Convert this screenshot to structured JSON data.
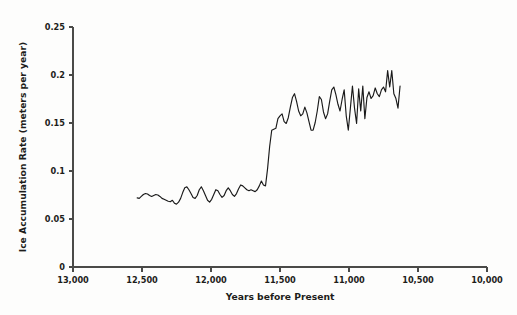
{
  "chart_data": {
    "type": "line",
    "title": "",
    "xlabel": "Years before Present",
    "ylabel": "Ice Accumulation Rate (meters per year)",
    "xlim": [
      13000,
      10000
    ],
    "ylim": [
      0,
      0.25
    ],
    "x_ticks": [
      13000,
      12500,
      12000,
      11500,
      11000,
      10500,
      10000
    ],
    "x_tick_labels": [
      "13,000",
      "12,500",
      "12,000",
      "11,500",
      "11,000",
      "10,500",
      "10,000"
    ],
    "y_ticks": [
      0,
      0.05,
      0.1,
      0.15,
      0.2,
      0.25
    ],
    "y_tick_labels": [
      "0",
      "0.05",
      "0.1",
      "0.15",
      "0.2",
      "0.25"
    ],
    "x_axis_inverted": true,
    "grid": false,
    "legend": null,
    "legend_position": "none",
    "series": [
      {
        "name": "Ice accumulation rate",
        "color": "#1a1a1a",
        "x": [
          12535,
          12520,
          12505,
          12490,
          12475,
          12460,
          12445,
          12430,
          12415,
          12400,
          12385,
          12370,
          12355,
          12340,
          12325,
          12310,
          12295,
          12280,
          12265,
          12250,
          12235,
          12220,
          12205,
          12190,
          12175,
          12160,
          12145,
          12130,
          12115,
          12100,
          12085,
          12070,
          12055,
          12040,
          12025,
          12010,
          11995,
          11980,
          11965,
          11950,
          11935,
          11920,
          11905,
          11890,
          11875,
          11860,
          11845,
          11830,
          11815,
          11800,
          11785,
          11770,
          11755,
          11740,
          11725,
          11710,
          11695,
          11680,
          11665,
          11650,
          11635,
          11620,
          11605,
          11590,
          11575,
          11560,
          11545,
          11530,
          11515,
          11500,
          11485,
          11470,
          11455,
          11440,
          11425,
          11410,
          11395,
          11380,
          11365,
          11350,
          11335,
          11320,
          11305,
          11290,
          11275,
          11260,
          11245,
          11230,
          11215,
          11200,
          11185,
          11170,
          11155,
          11140,
          11125,
          11110,
          11095,
          11080,
          11065,
          11050,
          11035,
          11020,
          11005,
          10990,
          10975,
          10960,
          10945,
          10930,
          10915,
          10900,
          10885,
          10870,
          10855,
          10840,
          10825,
          10810,
          10795,
          10780,
          10765,
          10750,
          10735,
          10720,
          10705,
          10690,
          10675,
          10660,
          10645,
          10630
        ],
        "y": [
          0.072,
          0.0715,
          0.0735,
          0.0755,
          0.0765,
          0.076,
          0.0745,
          0.0735,
          0.0745,
          0.0755,
          0.075,
          0.0735,
          0.0715,
          0.0705,
          0.0695,
          0.0685,
          0.068,
          0.0695,
          0.0665,
          0.0655,
          0.0675,
          0.0715,
          0.0775,
          0.0825,
          0.0835,
          0.0805,
          0.0765,
          0.0725,
          0.0715,
          0.0745,
          0.0805,
          0.0835,
          0.0795,
          0.0745,
          0.0695,
          0.0675,
          0.0705,
          0.0755,
          0.0805,
          0.0795,
          0.0755,
          0.0725,
          0.0745,
          0.0795,
          0.0825,
          0.0795,
          0.0755,
          0.0735,
          0.0765,
          0.0815,
          0.0855,
          0.0845,
          0.0825,
          0.0805,
          0.0795,
          0.0805,
          0.0795,
          0.0785,
          0.0805,
          0.0845,
          0.0895,
          0.0855,
          0.0845,
          0.1025,
          0.1255,
          0.1425,
          0.1435,
          0.1445,
          0.1545,
          0.1575,
          0.1595,
          0.1515,
          0.1495,
          0.1555,
          0.1665,
          0.1765,
          0.1805,
          0.1725,
          0.1625,
          0.1575,
          0.1595,
          0.1665,
          0.1605,
          0.1515,
          0.1425,
          0.1425,
          0.1505,
          0.1625,
          0.1775,
          0.1745,
          0.1615,
          0.1545,
          0.1595,
          0.1725,
          0.1845,
          0.1875,
          0.1795,
          0.1695,
          0.1625,
          0.1745,
          0.1845,
          0.1575,
          0.1425,
          0.1655,
          0.1885,
          0.1655,
          0.1495,
          0.1855,
          0.1625,
          0.1885,
          0.1545,
          0.1765,
          0.1825,
          0.1755,
          0.1785,
          0.1865,
          0.1805,
          0.1775,
          0.1845,
          0.1875,
          0.1825,
          0.2045,
          0.1875,
          0.2045,
          0.1805,
          0.1755,
          0.1655,
          0.1885
        ]
      }
    ]
  }
}
